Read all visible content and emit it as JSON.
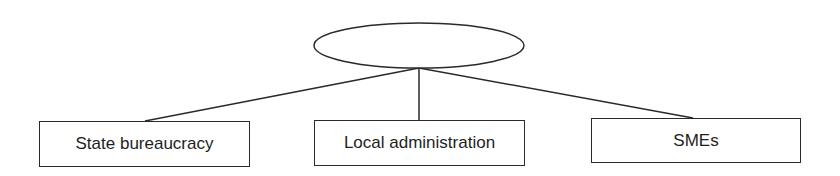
{
  "diagram": {
    "type": "hierarchy",
    "root": {
      "label": "",
      "shape": "ellipse"
    },
    "children": [
      {
        "label": "State bureaucracy",
        "shape": "rectangle"
      },
      {
        "label": "Local administration",
        "shape": "rectangle"
      },
      {
        "label": "SMEs",
        "shape": "rectangle"
      }
    ],
    "colors": {
      "stroke": "#2a2a2a",
      "text": "#1e1e1e",
      "background": "#ffffff"
    }
  }
}
